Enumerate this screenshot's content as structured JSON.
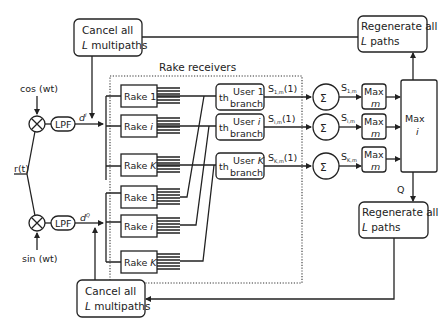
{
  "diagram": {
    "title": "Rake receivers",
    "inputs": {
      "signal": "r(t)",
      "cos": "cos (wt)",
      "sin": "sin (wt)",
      "lpf": "LPF",
      "d_i": "d",
      "d_i_sup": "I",
      "d_q": "d",
      "d_q_sup": "Q"
    },
    "cancel_top": {
      "line1": "Cancel all",
      "line2_l": "L",
      "line2_rest": " multipaths"
    },
    "cancel_bottom": {
      "line1": "Cancel all",
      "line2_l": "L",
      "line2_rest": " multipaths"
    },
    "regen_top": {
      "line1": "Regenerate all",
      "line2_l": "L",
      "line2_rest": " paths"
    },
    "regen_bottom": {
      "line1": "Regenerate all",
      "line2_l": "L",
      "line2_rest": " paths"
    },
    "rakes_upper": [
      {
        "label": "Rake ",
        "idx": "1"
      },
      {
        "label": "Rake ",
        "idx": "i"
      },
      {
        "label": "Rake ",
        "idx": "K"
      }
    ],
    "rakes_lower": [
      {
        "label": "Rake ",
        "idx": "1"
      },
      {
        "label": "Rake ",
        "idx": "i"
      },
      {
        "label": "Rake ",
        "idx": "K"
      }
    ],
    "branches": [
      {
        "th": "th",
        "user": "User ",
        "idx": "1",
        "branch": "branch",
        "out": "S",
        "out_sub": "1,m",
        "out_arg": "(1)",
        "sum_out": "S",
        "sum_out_sub": "1,m"
      },
      {
        "th": "th",
        "user": "User ",
        "idx": "i",
        "branch": "branch",
        "out": "S",
        "out_sub": "i,m",
        "out_arg": "(1)",
        "sum_out": "S",
        "sum_out_sub": "i,m"
      },
      {
        "th": "th",
        "user": "User ",
        "idx": "K",
        "branch": "branch",
        "out": "S",
        "out_sub": "K,m",
        "out_arg": "(1)",
        "sum_out": "S",
        "sum_out_sub": "K,m"
      }
    ],
    "sum_symbol": "Σ",
    "mixer_symbol": "⊗",
    "max_m": {
      "line1": "Max",
      "line2": "m"
    },
    "max_i": {
      "line1": "Max",
      "line2": "i"
    },
    "q_label": "Q"
  }
}
